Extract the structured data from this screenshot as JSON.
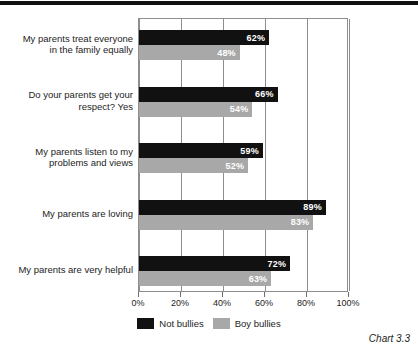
{
  "caption": "Chart 3.3",
  "chart_data": {
    "type": "bar",
    "orientation": "horizontal",
    "title": "",
    "subtitle": "",
    "xlabel": "",
    "ylabel": "",
    "xlim": [
      0,
      100
    ],
    "xticks": [
      0,
      20,
      40,
      60,
      80,
      100
    ],
    "xtick_labels": [
      "0%",
      "20%",
      "40%",
      "60%",
      "80%",
      "100%"
    ],
    "grid": true,
    "grid_axis": "x",
    "legend_position": "bottom-center",
    "value_label_suffix": "%",
    "categories": [
      "My parents treat everyone in the family equally",
      "Do your parents get your respect? Yes",
      "My parents listen to my problems and views",
      "My parents are loving",
      "My parents are very helpful"
    ],
    "category_lines": [
      [
        "My parents treat everyone",
        "in the family equally"
      ],
      [
        "Do your parents get your",
        "respect? Yes"
      ],
      [
        "My parents listen to my",
        "problems and views"
      ],
      [
        "My parents are loving"
      ],
      [
        "My parents are very helpful"
      ]
    ],
    "series": [
      {
        "name": "Not bullies",
        "color": "#111111",
        "values": [
          62,
          66,
          59,
          89,
          72
        ],
        "value_labels": [
          "62%",
          "66%",
          "59%",
          "89%",
          "72%"
        ]
      },
      {
        "name": "Boy bullies",
        "color": "#a8a8a8",
        "values": [
          48,
          54,
          52,
          83,
          63
        ],
        "value_labels": [
          "48%",
          "54%",
          "52%",
          "83%",
          "63%"
        ]
      }
    ]
  }
}
